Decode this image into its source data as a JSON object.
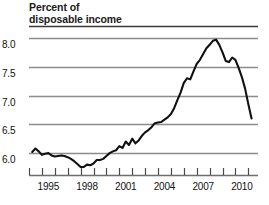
{
  "chart_data": {
    "type": "line",
    "title": "Percent of disposable income",
    "title_lines": [
      "Percent of",
      "disposable income"
    ],
    "xlabel": "",
    "ylabel": "Percent of disposable income",
    "xlim": [
      1994.0,
      2011.75
    ],
    "ylim": [
      5.62,
      8.12
    ],
    "ytick_values": [
      8.0,
      7.5,
      7.0,
      6.5,
      6.0
    ],
    "ytick_labels": [
      "8.0",
      "7.5",
      "7.0",
      "6.5",
      "6.0"
    ],
    "xtick_values": [
      1994,
      1995,
      1996,
      1997,
      1998,
      1999,
      2000,
      2001,
      2002,
      2003,
      2004,
      2005,
      2006,
      2007,
      2008,
      2009,
      2010,
      2011
    ],
    "xtick_labels_shown": [
      "1995",
      "1998",
      "2001",
      "2004",
      "2007",
      "2010"
    ],
    "xtick_labels_values": [
      1995,
      1998,
      2001,
      2004,
      2007,
      2010
    ],
    "grid": "horizontal",
    "grid_color": "#8c8c8c",
    "axis_color": "#6e6e6e",
    "line_color": "#111111",
    "line_width": 2.1,
    "legend": "none",
    "series": [
      {
        "name": "Household debt service ratio",
        "x": [
          1994.25,
          1994.5,
          1994.75,
          1995.0,
          1995.25,
          1995.5,
          1995.75,
          1996.0,
          1996.25,
          1996.5,
          1996.75,
          1997.0,
          1997.25,
          1997.5,
          1997.75,
          1998.0,
          1998.25,
          1998.5,
          1998.75,
          1999.0,
          1999.25,
          1999.5,
          1999.75,
          2000.0,
          2000.25,
          2000.5,
          2000.75,
          2001.0,
          2001.25,
          2001.5,
          2001.75,
          2002.0,
          2002.25,
          2002.5,
          2002.75,
          2003.0,
          2003.25,
          2003.5,
          2003.75,
          2004.0,
          2004.25,
          2004.5,
          2004.75,
          2005.0,
          2005.25,
          2005.5,
          2005.75,
          2006.0,
          2006.25,
          2006.5,
          2006.75,
          2007.0,
          2007.25,
          2007.5,
          2007.75,
          2008.0,
          2008.25,
          2008.5,
          2008.75,
          2009.0,
          2009.25,
          2009.5,
          2009.75,
          2010.0,
          2010.25,
          2010.5,
          2010.75,
          2011.0,
          2011.25
        ],
        "y": [
          6.02,
          6.08,
          6.03,
          5.97,
          5.99,
          6.0,
          5.96,
          5.94,
          5.95,
          5.96,
          5.95,
          5.93,
          5.9,
          5.86,
          5.81,
          5.76,
          5.76,
          5.8,
          5.79,
          5.82,
          5.88,
          5.88,
          5.9,
          5.95,
          6.0,
          6.03,
          6.05,
          6.12,
          6.09,
          6.2,
          6.14,
          6.25,
          6.17,
          6.22,
          6.3,
          6.36,
          6.4,
          6.45,
          6.52,
          6.53,
          6.54,
          6.58,
          6.62,
          6.68,
          6.78,
          6.92,
          7.05,
          7.22,
          7.3,
          7.28,
          7.42,
          7.55,
          7.62,
          7.72,
          7.82,
          7.88,
          7.95,
          7.97,
          7.88,
          7.75,
          7.6,
          7.58,
          7.66,
          7.62,
          7.48,
          7.32,
          7.12,
          6.85,
          6.6
        ]
      }
    ],
    "annotations": []
  }
}
